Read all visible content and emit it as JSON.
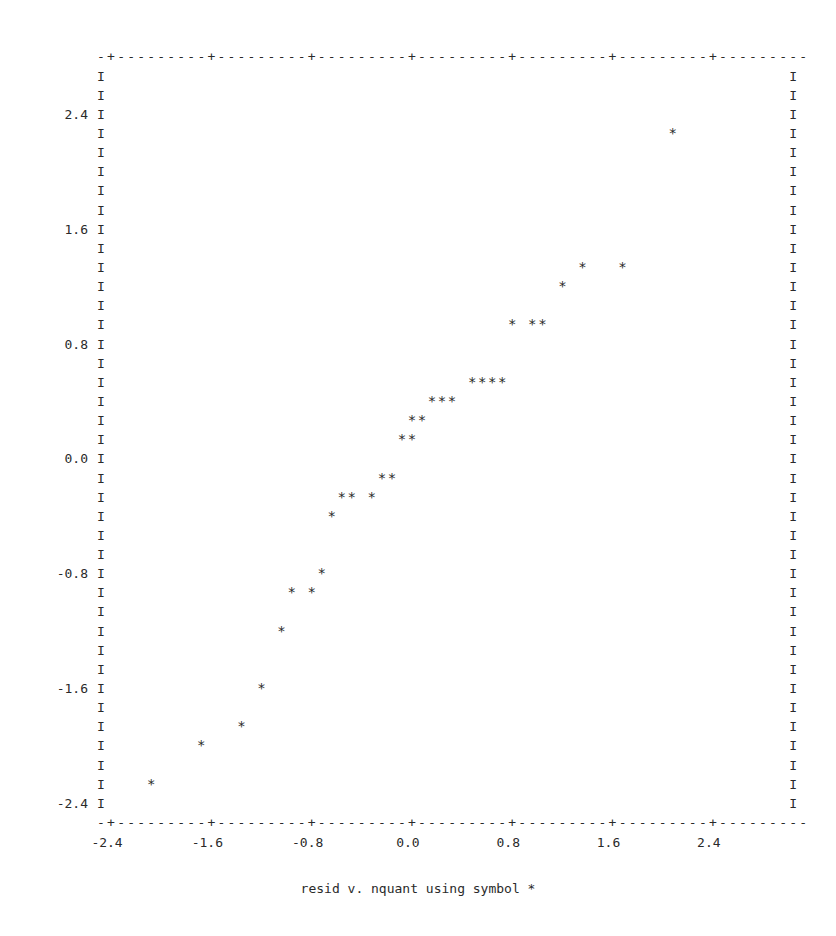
{
  "chart_data": {
    "type": "scatter",
    "title": "",
    "caption": "resid  v. nquant using symbol *",
    "xlabel": "nquant",
    "ylabel": "resid",
    "symbol": "*",
    "xlim": [
      -2.48,
      3.04
    ],
    "ylim": [
      -2.667,
      2.667
    ],
    "x_ticks": [
      -2.4,
      -1.6,
      -0.8,
      0.0,
      0.8,
      1.6,
      2.4
    ],
    "x_tick_labels": [
      "-2.4",
      "-1.6",
      "-0.8",
      "0.0",
      "0.8",
      "1.6",
      "2.4"
    ],
    "y_ticks": [
      2.4,
      1.6,
      0.8,
      0.0,
      -0.8,
      -1.6,
      -2.4
    ],
    "y_tick_labels": [
      "2.4",
      "1.6",
      "0.8",
      "0.0",
      "-0.8",
      "-1.6",
      "-2.4"
    ],
    "grid": false,
    "legend": null,
    "points": [
      {
        "x": -2.08,
        "y": -2.267
      },
      {
        "x": -1.68,
        "y": -2.0
      },
      {
        "x": -1.36,
        "y": -1.867
      },
      {
        "x": -1.2,
        "y": -1.6
      },
      {
        "x": -1.04,
        "y": -1.2
      },
      {
        "x": -0.96,
        "y": -0.933
      },
      {
        "x": -0.8,
        "y": -0.933
      },
      {
        "x": -0.72,
        "y": -0.8
      },
      {
        "x": -0.64,
        "y": -0.4
      },
      {
        "x": -0.56,
        "y": -0.267
      },
      {
        "x": -0.48,
        "y": -0.267
      },
      {
        "x": -0.32,
        "y": -0.267
      },
      {
        "x": -0.24,
        "y": -0.133
      },
      {
        "x": -0.16,
        "y": -0.133
      },
      {
        "x": -0.08,
        "y": 0.133
      },
      {
        "x": 0.0,
        "y": 0.133
      },
      {
        "x": 0.0,
        "y": 0.267
      },
      {
        "x": 0.08,
        "y": 0.267
      },
      {
        "x": 0.16,
        "y": 0.4
      },
      {
        "x": 0.24,
        "y": 0.4
      },
      {
        "x": 0.32,
        "y": 0.4
      },
      {
        "x": 0.48,
        "y": 0.533
      },
      {
        "x": 0.56,
        "y": 0.533
      },
      {
        "x": 0.64,
        "y": 0.533
      },
      {
        "x": 0.72,
        "y": 0.533
      },
      {
        "x": 0.8,
        "y": 0.933
      },
      {
        "x": 0.96,
        "y": 0.933
      },
      {
        "x": 1.04,
        "y": 0.933
      },
      {
        "x": 1.2,
        "y": 1.2
      },
      {
        "x": 1.36,
        "y": 1.333
      },
      {
        "x": 1.68,
        "y": 1.333
      },
      {
        "x": 2.08,
        "y": 2.267
      }
    ]
  },
  "plot": {
    "frame": {
      "top_border": "-+---------+---------+---------+---------+---------+---------+---------",
      "bottom_border": "-+---------+---------+---------+---------+---------+---------+---------",
      "side_char": "I",
      "rows": 39,
      "cols": 70
    },
    "caption": "resid  v. nquant using symbol *"
  }
}
